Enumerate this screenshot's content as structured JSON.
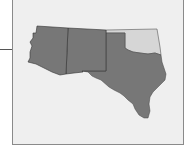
{
  "map": {
    "description": "South-central United States locator map",
    "regions": [
      {
        "name": "Arizona",
        "highlighted": true,
        "fill": "#777777"
      },
      {
        "name": "New Mexico",
        "highlighted": true,
        "fill": "#777777"
      },
      {
        "name": "Texas",
        "highlighted": true,
        "fill": "#777777"
      },
      {
        "name": "Oklahoma",
        "highlighted": false,
        "fill": "#d6d6d6"
      }
    ],
    "colors": {
      "background": "#efefef",
      "frame_border": "#8a8a8a",
      "state_border": "#333333"
    }
  }
}
